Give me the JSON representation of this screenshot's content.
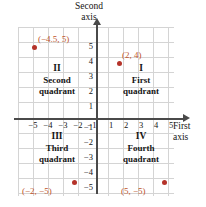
{
  "figure": {
    "axes": {
      "vertical_title_line1": "Second",
      "vertical_title_line2": "axis",
      "horizontal_title_line1": "First",
      "horizontal_title_line2": "axis",
      "axis_color": "#4a4a4a",
      "grid_color": "#d4d4d4"
    },
    "ticks": {
      "x": [
        "−5",
        "−4",
        "−3",
        "−2",
        "−1",
        "1",
        "2",
        "3",
        "4",
        "5"
      ],
      "y": [
        "5",
        "4",
        "3",
        "2",
        "1",
        "−1",
        "−2",
        "−3",
        "−4",
        "−5"
      ]
    },
    "quadrants": [
      {
        "roman": "I",
        "name": "First quadrant",
        "name_line1": "First",
        "name_line2": "quadrant"
      },
      {
        "roman": "II",
        "name": "Second quadrant",
        "name_line1": "Second",
        "name_line2": "quadrant"
      },
      {
        "roman": "III",
        "name": "Third quadrant",
        "name_line1": "Third",
        "name_line2": "quadrant"
      },
      {
        "roman": "IV",
        "name": "Fourth quadrant",
        "name_line1": "Fourth",
        "name_line2": "quadrant"
      }
    ],
    "points": [
      {
        "label": "(−4.5, 5)",
        "x": -4.5,
        "y": 5,
        "quadrant": "II"
      },
      {
        "label": "(2, 4)",
        "x": 2,
        "y": 4,
        "quadrant": "I"
      },
      {
        "label": "(−2, −5)",
        "x": -2,
        "y": -5,
        "quadrant": "III"
      },
      {
        "label": "(5, −5)",
        "x": 5,
        "y": -5,
        "quadrant": "IV"
      }
    ],
    "colors": {
      "point_marker": "#b5332a",
      "point_label": "#c0562c",
      "text": "#141414"
    }
  }
}
